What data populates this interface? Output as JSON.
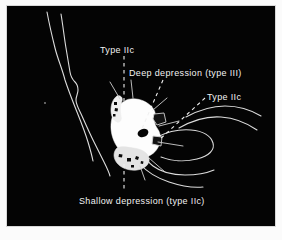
{
  "figure": {
    "background_color": "#ffffff",
    "plate_color": "#040404",
    "stroke_color": "#e8e8e8",
    "lesion_fill": "#fdfdfd",
    "label_color": "#f2f2f2",
    "caption_alt": "Black-background schematic drawing of a gastric mucosal lesion with four dashed leader labels"
  },
  "labels": {
    "type_iic_top": "Type IIc",
    "deep_depression": "Deep depression (type III)",
    "type_iic_right": "Type IIc",
    "shallow_depression": "Shallow depression (type IIc)"
  },
  "annotations": [
    {
      "id": "type-iic-top",
      "text": "Type IIc",
      "leader": "vertical-dashed",
      "points_to": "upper-left margin of lesion"
    },
    {
      "id": "deep-depression",
      "text": "Deep depression (type III)",
      "leader": "diagonal-dashed",
      "points_to": "dark pit in centre of lesion"
    },
    {
      "id": "type-iic-right",
      "text": "Type IIc",
      "leader": "diagonal-dashed",
      "points_to": "right margin nodule of lesion"
    },
    {
      "id": "shallow-depression",
      "text": "Shallow depression (type IIc)",
      "leader": "vertical-dashed",
      "points_to": "lower margin of lesion"
    }
  ],
  "drawing_elements": {
    "left_folds": "two long wavy near-vertical mucosal fold lines",
    "right_folds": "four curved mucosal fold lines converging toward lesion",
    "lesion": "irregular white elevated lesion with dark depressions",
    "dark_spots": "three dark depressed areas inside the lesion"
  }
}
